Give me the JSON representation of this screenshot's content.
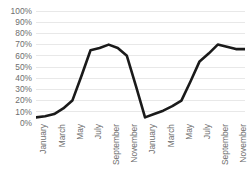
{
  "chart_data": {
    "type": "line",
    "title": "",
    "xlabel": "",
    "ylabel": "",
    "ylim": [
      0,
      1.0
    ],
    "grid": true,
    "legend": false,
    "y_ticks": [
      "100%",
      "90%",
      "80%",
      "70%",
      "60%",
      "50%",
      "40%",
      "30%",
      "20%",
      "10%",
      "0%"
    ],
    "y_tick_values": [
      1.0,
      0.9,
      0.8,
      0.7,
      0.6,
      0.5,
      0.4,
      0.3,
      0.2,
      0.1,
      0.0
    ],
    "categories": [
      "January",
      "February",
      "March",
      "April",
      "May",
      "June",
      "July",
      "August",
      "September",
      "October",
      "November",
      "December",
      "January",
      "February",
      "March",
      "April",
      "May",
      "June",
      "July",
      "August",
      "September",
      "October",
      "November",
      "December"
    ],
    "x_tick_labels": [
      "January",
      "March",
      "May",
      "July",
      "September",
      "November",
      "January",
      "March",
      "May",
      "July",
      "September",
      "November"
    ],
    "x_tick_indices": [
      0,
      2,
      4,
      6,
      8,
      10,
      12,
      14,
      16,
      18,
      20,
      22
    ],
    "series": [
      {
        "name": "Series 1",
        "color": "#1a1a1a",
        "values": [
          0.05,
          0.06,
          0.08,
          0.13,
          0.2,
          0.42,
          0.65,
          0.67,
          0.7,
          0.67,
          0.6,
          0.33,
          0.05,
          0.08,
          0.11,
          0.15,
          0.2,
          0.37,
          0.55,
          0.62,
          0.7,
          0.68,
          0.66,
          0.66
        ]
      }
    ]
  },
  "colors": {
    "line": "#1a1a1a",
    "gridline": "#e8e8e8",
    "tick_text": "#6e6e6e",
    "background": "#ffffff"
  }
}
